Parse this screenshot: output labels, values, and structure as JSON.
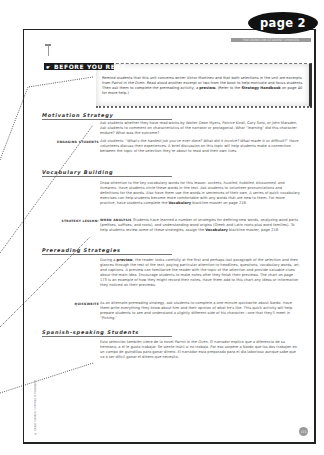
{
  "page_tab": "page 2",
  "top_banner": "FOCUSING ON STUDENT CHOICES",
  "section_title": "BEFORE YOU READ",
  "intro": {
    "text_1": "Remind students that this unit concerns writer Victor Martinez and that both selections in the unit are excerpts from ",
    "italic_1": "Parrot in the Oven",
    "text_2": ". Read aloud another excerpt or two from the book to help motivate and focus students. Then ask them to complete the prereading activity, a ",
    "bold_1": "preview.",
    "text_3": " (Refer to the ",
    "bold_2": "Strategy Handbook",
    "text_4": " on page 40 for more help.)"
  },
  "sections": {
    "motivation": {
      "heading": "Motivation Strategy",
      "para": "Ask students whether they have read works by Walter Dean Myers, Patrice Kindl, Gary Soto, or John Marsden. Ask students to comment on characteristics of the narrator or protagonist. What \"learning\" did this character endure? What was the outcome?",
      "label": "ENGAGING STUDENTS",
      "engaging_text_1": "Ask students: \"What's the hardest job you've ever done? What did it involve? What made it so difficult?\"",
      "engaging_text_2": " Have volunteers discuss their experiences. A brief discussion on this topic will help students make a connection between the topic of the selection they're about to read and their own lives."
    },
    "vocabulary": {
      "heading": "Vocabulary Building",
      "para_1": "Draw attention to the key vocabulary words for this lesson: ",
      "para_words": "sockets, hustled, hobbled, blossomed,",
      "para_and": " and ",
      "para_word_last": "forearms",
      "para_2": ". Have students circle these words in the text. Ask students to volunteer pronunciations and definitions for the words. Also have them use the words in sentences of their own. A series of quick vocabulary exercises can help students become more comfortable with any words that are new to them. For more practice, have students complete the ",
      "para_bold": "Vocabulary",
      "para_3": " blackline master on page 218.",
      "label": "STRATEGY LESSON:",
      "lesson_bold": "WORD ANALYSIS",
      "lesson_1": " Students have learned a number of strategies for defining new words, analyzing word parts (prefixes, suffixes, and roots), and understanding word origins (Greek and Latin roots plus word families). To help students review some of these strategies, assign the ",
      "lesson_bold_2": "Vocabulary",
      "lesson_2": " blackline master, page 218."
    },
    "prereading": {
      "heading": "Prereading Strategies",
      "para_1": "During a ",
      "para_bold": "preview",
      "para_2": ", the reader looks carefully at the first and perhaps last paragraph of the selection and then glances through the rest of the text, paying particular attention to headlines, questions, vocabulary words, art, and captions. A preview can familiarize the reader with the topic of the selection and provide valuable clues about the main idea. Encourage students to make notes after they finish their previews. The chart on page 173 is an example of how they might record their notes. Have them add to this chart any ideas or information they noticed on their previews.",
      "label": "QUICKWRITE",
      "quick_text": "As an alternate prereading strategy, ask students to complete a one-minute quickwrite about Nardo. Have them write everything they know about him and their opinion of what he's like. This quick activity will help prepare students to see and understand a slightly different side of his character—one that they'll meet in \"Picking.\""
    },
    "spanish": {
      "heading": "Spanish-speaking Students",
      "para_1": "Esta selección también viene de la novel ",
      "para_italic": "Parrot in the Oven",
      "para_2": ". El narrador explica que a diferencia de su hermano, a él le gusta trabajar. Se siente inútil si no trabaja. Por eso sorpere a Nardo que los dos trabajen en un campo de guindillas para ganar dinero. El narrador está preparado para el día laborioso aunque sabe que va a ser difícil ganar el dinero que necesita."
    }
  },
  "copyright": "© GREAT SOURCE. COPYING IS PROHIBITED.",
  "page_number": "173"
}
